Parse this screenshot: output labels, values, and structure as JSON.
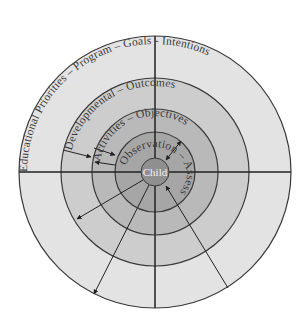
{
  "diagram": {
    "center": {
      "label": "Child"
    },
    "rings": [
      {
        "level": 1,
        "label": "Observation – Assessments",
        "fill": "#a6a6a6"
      },
      {
        "level": 2,
        "label": "Activities – Objectives",
        "fill": "#b9b9b9"
      },
      {
        "level": 3,
        "label": "Developmental – Outcomes",
        "fill": "#cdcdcd"
      },
      {
        "level": 4,
        "label": "Educational Priorities – Program – Goals - Intentions",
        "fill": "#e3e3e3"
      }
    ],
    "ring_text": {
      "outer": "Educational Priorities – Program – Goals - Intentions",
      "third": "Developmental –   Outcomes",
      "second": "Activities –   Objectives",
      "inner": "Observation – Assessments"
    },
    "colors": {
      "child_fill": "#8f8f8f",
      "line": "#333333",
      "background": "#ffffff"
    },
    "connectors": [
      {
        "name": "outer-left-inward",
        "direction": "inward"
      },
      {
        "name": "mid-left-inward",
        "direction": "inward"
      },
      {
        "name": "mid-left-outward",
        "direction": "outward"
      },
      {
        "name": "upper-right-bidirectional",
        "direction": "both"
      },
      {
        "name": "lower-left-outward-short",
        "direction": "outward"
      },
      {
        "name": "lower-left-outward-long",
        "direction": "outward"
      },
      {
        "name": "lower-right-inward",
        "direction": "inward"
      }
    ]
  }
}
